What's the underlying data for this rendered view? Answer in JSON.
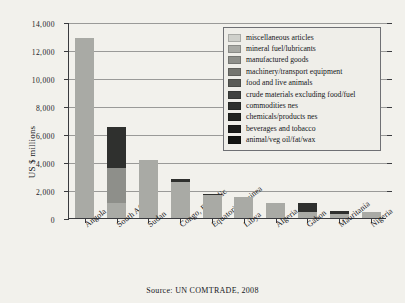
{
  "chart_data": {
    "type": "bar",
    "stacked": true,
    "title": "",
    "subtitle": "",
    "xlabel": "",
    "ylabel": "US $ millions",
    "ylim": [
      0,
      14000
    ],
    "ytick_labels": [
      "0",
      "2,000",
      "4,000",
      "6,000",
      "8,000",
      "10,000",
      "12,000",
      "14,000"
    ],
    "ytick_values": [
      0,
      2000,
      4000,
      6000,
      8000,
      10000,
      12000,
      14000
    ],
    "grid": true,
    "legend_position": "upper right",
    "categories": [
      "Angola",
      "South Africa",
      "Sudan",
      "Congo, Republic",
      "Equatorial Guinea",
      "Libya",
      "Algeria",
      "Gabon",
      "Mauritania",
      "Nigeria"
    ],
    "series": [
      {
        "name": "miscellaneous articles",
        "color": "#cfd0cb",
        "values": [
          0,
          0,
          0,
          0,
          0,
          0,
          0,
          0,
          0,
          0
        ]
      },
      {
        "name": "mineral fuel/lubricants",
        "color": "#a9aaa5",
        "values": [
          12850,
          1100,
          4150,
          2580,
          1630,
          1480,
          1090,
          420,
          320,
          460
        ]
      },
      {
        "name": "manufactured goods",
        "color": "#8e8f8a",
        "values": [
          0,
          2450,
          0,
          0,
          0,
          0,
          0,
          0,
          0,
          0
        ]
      },
      {
        "name": "machinery/transport equipment",
        "color": "#74756f",
        "values": [
          0,
          0,
          0,
          0,
          0,
          0,
          0,
          0,
          0,
          0
        ]
      },
      {
        "name": "food and live animals",
        "color": "#5a5b56",
        "values": [
          0,
          0,
          0,
          0,
          0,
          0,
          0,
          0,
          0,
          0
        ]
      },
      {
        "name": "crude materials excluding food/fuel",
        "color": "#414240",
        "values": [
          0,
          0,
          0,
          0,
          0,
          0,
          0,
          0,
          0,
          0
        ]
      },
      {
        "name": "commodities nes",
        "color": "#2f302e",
        "values": [
          0,
          2950,
          0,
          210,
          60,
          0,
          0,
          620,
          180,
          0
        ]
      },
      {
        "name": "chemicals/products nes",
        "color": "#232422",
        "values": [
          0,
          0,
          0,
          0,
          0,
          0,
          0,
          0,
          0,
          0
        ]
      },
      {
        "name": "beverages and tobacco",
        "color": "#1b1c1a",
        "values": [
          0,
          0,
          0,
          0,
          0,
          0,
          0,
          0,
          0,
          0
        ]
      },
      {
        "name": "animal/veg oil/fat/wax",
        "color": "#121311",
        "values": [
          0,
          0,
          0,
          0,
          0,
          0,
          0,
          0,
          0,
          0
        ]
      }
    ],
    "totals": [
      12850,
      6500,
      4150,
      2790,
      1690,
      1480,
      1090,
      1040,
      500,
      460
    ]
  },
  "caption": "Source: UN COMTRADE, 2008"
}
